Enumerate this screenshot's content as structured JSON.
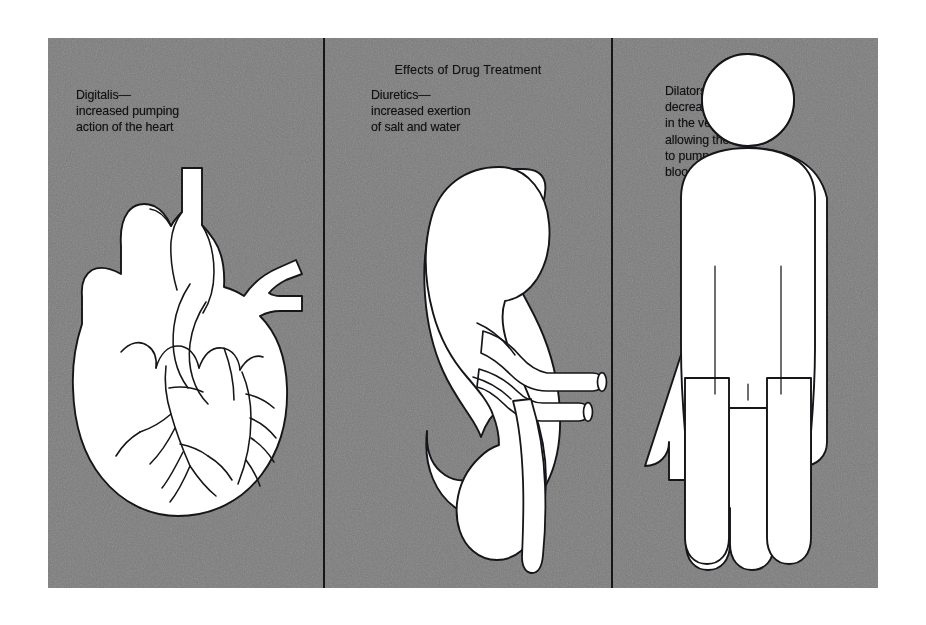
{
  "figure": {
    "title": "Effects of  Drug  Treatment",
    "plate_color": "#7b7b7b",
    "ink_color": "#111114",
    "organ_fill": "#ffffff",
    "panel_count": 3
  },
  "panels": [
    {
      "id": "heart",
      "drug_class": "Digitalis",
      "caption": "Digitalis—\nincreased pumping\naction of the heart",
      "illustration": "heart-with-coronary-arteries",
      "organ": "heart"
    },
    {
      "id": "kidney",
      "drug_class": "Diuretics",
      "caption": "Diuretics—\nincreased exertion\nof salt and water",
      "illustration": "kidney-with-renal-vessels-and-ureter",
      "organ": "kidney"
    },
    {
      "id": "body",
      "drug_class": "Dilators",
      "caption": "Dilators—\ndecreased pressure\nin the vessels,\nallowing the heart\nto pump more\nblood",
      "illustration": "human-figure-pictogram",
      "organ": "whole-body"
    }
  ],
  "icons": {
    "heart": "heart-icon",
    "kidney": "kidney-icon",
    "person": "person-figure-icon"
  }
}
